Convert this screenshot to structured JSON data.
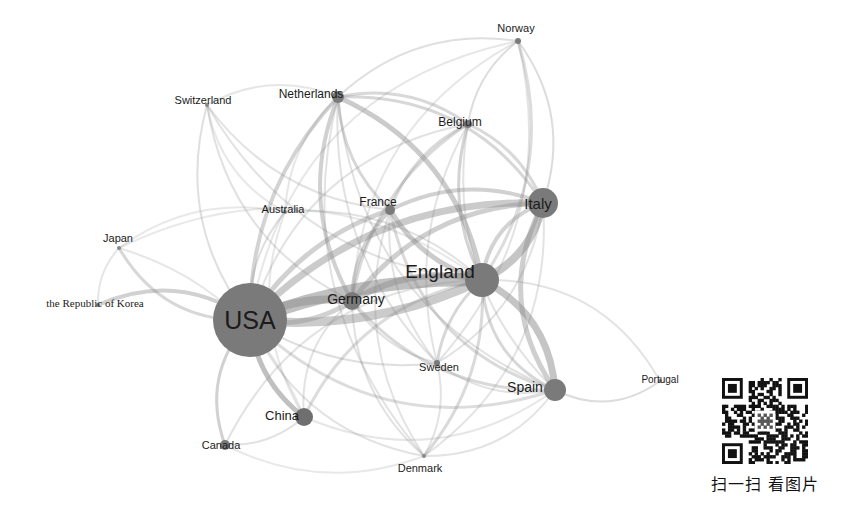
{
  "chart_data": {
    "type": "network-graph",
    "title": "",
    "background": "#ffffff",
    "node_color": "#7d7d7d",
    "edge_color": "#8c8c8c",
    "label_color": "#1b1b1b",
    "layout": "force-directed",
    "width": 842,
    "height": 505,
    "nodes": [
      {
        "id": "usa",
        "label": "USA",
        "x": 250,
        "y": 320,
        "r": 37,
        "font_size": 25,
        "label_dx": 0,
        "label_dy": 0,
        "color": "#7a7a7a",
        "serif": false
      },
      {
        "id": "england",
        "label": "England",
        "x": 482,
        "y": 280,
        "r": 17,
        "font_size": 19,
        "label_dx": -42,
        "label_dy": -9,
        "color": "#7a7a7a",
        "serif": false
      },
      {
        "id": "italy",
        "label": "Italy",
        "x": 543,
        "y": 203,
        "r": 15,
        "font_size": 15,
        "label_dx": -5,
        "label_dy": 0,
        "color": "#7a7a7a",
        "serif": false
      },
      {
        "id": "spain",
        "label": "Spain",
        "x": 555,
        "y": 390,
        "r": 11,
        "font_size": 14,
        "label_dx": -30,
        "label_dy": -3,
        "color": "#7a7a7a",
        "serif": false
      },
      {
        "id": "germany",
        "label": "Germany",
        "x": 352,
        "y": 301,
        "r": 9,
        "font_size": 14,
        "label_dx": 4,
        "label_dy": -2,
        "color": "#7a7a7a",
        "serif": false
      },
      {
        "id": "china",
        "label": "China",
        "x": 304,
        "y": 417,
        "r": 9,
        "font_size": 13,
        "label_dx": -22,
        "label_dy": -2,
        "color": "#6f6f6f",
        "serif": false
      },
      {
        "id": "france",
        "label": "France",
        "x": 390,
        "y": 210,
        "r": 5,
        "font_size": 12,
        "label_dx": -12,
        "label_dy": -8,
        "color": "#7a7a7a",
        "serif": false
      },
      {
        "id": "netherlands",
        "label": "Netherlands",
        "x": 338,
        "y": 97,
        "r": 6,
        "font_size": 12,
        "label_dx": -27,
        "label_dy": -3,
        "color": "#7a7a7a",
        "serif": false
      },
      {
        "id": "canada",
        "label": "Canada",
        "x": 225,
        "y": 445,
        "r": 5,
        "font_size": 11,
        "label_dx": -4,
        "label_dy": 0,
        "color": "#7a7a7a",
        "serif": false
      },
      {
        "id": "belgium",
        "label": "Belgium",
        "x": 468,
        "y": 124,
        "r": 4,
        "font_size": 12,
        "label_dx": -8,
        "label_dy": -2,
        "color": "#7a7a7a",
        "serif": false
      },
      {
        "id": "norway",
        "label": "Norway",
        "x": 518,
        "y": 41,
        "r": 3,
        "font_size": 11,
        "label_dx": -2,
        "label_dy": -13,
        "color": "#7a7a7a",
        "serif": false
      },
      {
        "id": "sweden",
        "label": "Sweden",
        "x": 437,
        "y": 363,
        "r": 3,
        "font_size": 11,
        "label_dx": 2,
        "label_dy": 4,
        "color": "#7a7a7a",
        "serif": false
      },
      {
        "id": "switzerland",
        "label": "Switzerland",
        "x": 207,
        "y": 105,
        "r": 2,
        "font_size": 11,
        "label_dx": -4,
        "label_dy": -5,
        "color": "#8a8a8a",
        "serif": false
      },
      {
        "id": "australia",
        "label": "Australia",
        "x": 285,
        "y": 212,
        "r": 2,
        "font_size": 11,
        "label_dx": -2,
        "label_dy": -3,
        "color": "#8a8a8a",
        "serif": false
      },
      {
        "id": "japan",
        "label": "Japan",
        "x": 119,
        "y": 248,
        "r": 2,
        "font_size": 11,
        "label_dx": -1,
        "label_dy": -10,
        "color": "#8a8a8a",
        "serif": false
      },
      {
        "id": "korea",
        "label": "the Republic of Korea",
        "x": 98,
        "y": 305,
        "r": 2,
        "font_size": 11,
        "label_dx": -3,
        "label_dy": -2,
        "color": "#8a8a8a",
        "serif": true
      },
      {
        "id": "denmark",
        "label": "Denmark",
        "x": 424,
        "y": 456,
        "r": 2,
        "font_size": 11,
        "label_dx": -4,
        "label_dy": 12,
        "color": "#8a8a8a",
        "serif": false
      },
      {
        "id": "portugal",
        "label": "Portugal",
        "x": 660,
        "y": 381,
        "r": 2,
        "font_size": 10,
        "label_dx": 0,
        "label_dy": -1,
        "color": "#8a8a8a",
        "serif": false
      }
    ],
    "edges": [
      {
        "source": "usa",
        "target": "england",
        "weight": 10,
        "width": 13,
        "opacity": 0.55,
        "curve": -0.1
      },
      {
        "source": "usa",
        "target": "england",
        "weight": 8,
        "width": 9,
        "opacity": 0.45,
        "curve": 0.14
      },
      {
        "source": "usa",
        "target": "germany",
        "weight": 7,
        "width": 8,
        "opacity": 0.5,
        "curve": -0.16
      },
      {
        "source": "usa",
        "target": "germany",
        "weight": 5,
        "width": 5,
        "opacity": 0.4,
        "curve": 0.2
      },
      {
        "source": "usa",
        "target": "italy",
        "weight": 6,
        "width": 7,
        "opacity": 0.45,
        "curve": -0.22
      },
      {
        "source": "usa",
        "target": "france",
        "weight": 4,
        "width": 5,
        "opacity": 0.4,
        "curve": -0.18
      },
      {
        "source": "usa",
        "target": "netherlands",
        "weight": 4,
        "width": 4,
        "opacity": 0.38,
        "curve": -0.2
      },
      {
        "source": "usa",
        "target": "china",
        "weight": 5,
        "width": 5,
        "opacity": 0.55,
        "curve": 0.22
      },
      {
        "source": "usa",
        "target": "canada",
        "weight": 3,
        "width": 3,
        "opacity": 0.4,
        "curve": 0.3
      },
      {
        "source": "usa",
        "target": "japan",
        "weight": 3,
        "width": 3,
        "opacity": 0.35,
        "curve": -0.3
      },
      {
        "source": "usa",
        "target": "korea",
        "weight": 3,
        "width": 4,
        "opacity": 0.4,
        "curve": 0.28
      },
      {
        "source": "usa",
        "target": "switzerland",
        "weight": 2,
        "width": 2,
        "opacity": 0.28,
        "curve": -0.25
      },
      {
        "source": "usa",
        "target": "australia",
        "weight": 2,
        "width": 2,
        "opacity": 0.28,
        "curve": -0.2
      },
      {
        "source": "usa",
        "target": "spain",
        "weight": 3,
        "width": 3,
        "opacity": 0.3,
        "curve": 0.3
      },
      {
        "source": "usa",
        "target": "sweden",
        "weight": 2,
        "width": 2,
        "opacity": 0.28,
        "curve": 0.18
      },
      {
        "source": "usa",
        "target": "denmark",
        "weight": 2,
        "width": 2,
        "opacity": 0.25,
        "curve": 0.26
      },
      {
        "source": "usa",
        "target": "belgium",
        "weight": 2,
        "width": 2,
        "opacity": 0.25,
        "curve": -0.3
      },
      {
        "source": "usa",
        "target": "norway",
        "weight": 2,
        "width": 2,
        "opacity": 0.22,
        "curve": -0.34
      },
      {
        "source": "england",
        "target": "italy",
        "weight": 7,
        "width": 8,
        "opacity": 0.5,
        "curve": 0.25
      },
      {
        "source": "england",
        "target": "italy",
        "weight": 4,
        "width": 4,
        "opacity": 0.38,
        "curve": -0.3
      },
      {
        "source": "england",
        "target": "spain",
        "weight": 6,
        "width": 7,
        "opacity": 0.5,
        "curve": -0.28
      },
      {
        "source": "england",
        "target": "spain",
        "weight": 3,
        "width": 3,
        "opacity": 0.35,
        "curve": 0.3
      },
      {
        "source": "england",
        "target": "germany",
        "weight": 6,
        "width": 6,
        "opacity": 0.45,
        "curve": 0.2
      },
      {
        "source": "england",
        "target": "france",
        "weight": 5,
        "width": 5,
        "opacity": 0.45,
        "curve": -0.2
      },
      {
        "source": "england",
        "target": "netherlands",
        "weight": 5,
        "width": 5,
        "opacity": 0.45,
        "curve": 0.26
      },
      {
        "source": "england",
        "target": "belgium",
        "weight": 3,
        "width": 3,
        "opacity": 0.38,
        "curve": -0.2
      },
      {
        "source": "england",
        "target": "sweden",
        "weight": 3,
        "width": 3,
        "opacity": 0.35,
        "curve": 0.18
      },
      {
        "source": "england",
        "target": "denmark",
        "weight": 3,
        "width": 3,
        "opacity": 0.32,
        "curve": -0.2
      },
      {
        "source": "england",
        "target": "norway",
        "weight": 3,
        "width": 3,
        "opacity": 0.3,
        "curve": 0.24
      },
      {
        "source": "england",
        "target": "china",
        "weight": 3,
        "width": 3,
        "opacity": 0.3,
        "curve": 0.25
      },
      {
        "source": "england",
        "target": "canada",
        "weight": 2,
        "width": 2,
        "opacity": 0.25,
        "curve": 0.3
      },
      {
        "source": "england",
        "target": "switzerland",
        "weight": 2,
        "width": 2,
        "opacity": 0.25,
        "curve": -0.26
      },
      {
        "source": "england",
        "target": "australia",
        "weight": 2,
        "width": 2,
        "opacity": 0.26,
        "curve": 0.22
      },
      {
        "source": "england",
        "target": "portugal",
        "weight": 2,
        "width": 2,
        "opacity": 0.24,
        "curve": -0.3
      },
      {
        "source": "england",
        "target": "japan",
        "weight": 2,
        "width": 2,
        "opacity": 0.2,
        "curve": 0.3
      },
      {
        "source": "italy",
        "target": "spain",
        "weight": 4,
        "width": 5,
        "opacity": 0.42,
        "curve": 0.3
      },
      {
        "source": "italy",
        "target": "france",
        "weight": 4,
        "width": 4,
        "opacity": 0.4,
        "curve": 0.22
      },
      {
        "source": "italy",
        "target": "germany",
        "weight": 4,
        "width": 5,
        "opacity": 0.42,
        "curve": 0.24
      },
      {
        "source": "italy",
        "target": "netherlands",
        "weight": 3,
        "width": 3,
        "opacity": 0.35,
        "curve": 0.28
      },
      {
        "source": "italy",
        "target": "belgium",
        "weight": 3,
        "width": 3,
        "opacity": 0.33,
        "curve": 0.2
      },
      {
        "source": "italy",
        "target": "norway",
        "weight": 2,
        "width": 2,
        "opacity": 0.3,
        "curve": 0.26
      },
      {
        "source": "italy",
        "target": "sweden",
        "weight": 2,
        "width": 2,
        "opacity": 0.26,
        "curve": -0.24
      },
      {
        "source": "italy",
        "target": "denmark",
        "weight": 2,
        "width": 2,
        "opacity": 0.24,
        "curve": -0.28
      },
      {
        "source": "germany",
        "target": "france",
        "weight": 4,
        "width": 4,
        "opacity": 0.4,
        "curve": -0.2
      },
      {
        "source": "germany",
        "target": "netherlands",
        "weight": 4,
        "width": 4,
        "opacity": 0.4,
        "curve": -0.24
      },
      {
        "source": "germany",
        "target": "spain",
        "weight": 3,
        "width": 3,
        "opacity": 0.33,
        "curve": 0.24
      },
      {
        "source": "germany",
        "target": "belgium",
        "weight": 3,
        "width": 3,
        "opacity": 0.32,
        "curve": -0.22
      },
      {
        "source": "germany",
        "target": "sweden",
        "weight": 2,
        "width": 2,
        "opacity": 0.28,
        "curve": 0.2
      },
      {
        "source": "germany",
        "target": "denmark",
        "weight": 2,
        "width": 2,
        "opacity": 0.26,
        "curve": 0.22
      },
      {
        "source": "germany",
        "target": "switzerland",
        "weight": 2,
        "width": 2,
        "opacity": 0.26,
        "curve": -0.26
      },
      {
        "source": "germany",
        "target": "norway",
        "weight": 2,
        "width": 2,
        "opacity": 0.22,
        "curve": -0.28
      },
      {
        "source": "germany",
        "target": "china",
        "weight": 2,
        "width": 2,
        "opacity": 0.25,
        "curve": 0.26
      },
      {
        "source": "france",
        "target": "netherlands",
        "weight": 3,
        "width": 3,
        "opacity": 0.35,
        "curve": -0.2
      },
      {
        "source": "france",
        "target": "belgium",
        "weight": 3,
        "width": 3,
        "opacity": 0.33,
        "curve": -0.2
      },
      {
        "source": "france",
        "target": "spain",
        "weight": 3,
        "width": 3,
        "opacity": 0.32,
        "curve": 0.3
      },
      {
        "source": "france",
        "target": "sweden",
        "weight": 2,
        "width": 2,
        "opacity": 0.25,
        "curve": 0.2
      },
      {
        "source": "france",
        "target": "denmark",
        "weight": 2,
        "width": 2,
        "opacity": 0.24,
        "curve": 0.24
      },
      {
        "source": "france",
        "target": "switzerland",
        "weight": 2,
        "width": 2,
        "opacity": 0.25,
        "curve": -0.22
      },
      {
        "source": "netherlands",
        "target": "belgium",
        "weight": 3,
        "width": 3,
        "opacity": 0.34,
        "curve": -0.22
      },
      {
        "source": "netherlands",
        "target": "norway",
        "weight": 2,
        "width": 2,
        "opacity": 0.28,
        "curve": -0.24
      },
      {
        "source": "netherlands",
        "target": "sweden",
        "weight": 2,
        "width": 2,
        "opacity": 0.26,
        "curve": 0.22
      },
      {
        "source": "netherlands",
        "target": "denmark",
        "weight": 2,
        "width": 2,
        "opacity": 0.25,
        "curve": 0.26
      },
      {
        "source": "netherlands",
        "target": "spain",
        "weight": 2,
        "width": 2,
        "opacity": 0.26,
        "curve": 0.3
      },
      {
        "source": "netherlands",
        "target": "australia",
        "weight": 2,
        "width": 2,
        "opacity": 0.22,
        "curve": 0.2
      },
      {
        "source": "netherlands",
        "target": "switzerland",
        "weight": 2,
        "width": 2,
        "opacity": 0.22,
        "curve": 0.24
      },
      {
        "source": "belgium",
        "target": "norway",
        "weight": 2,
        "width": 2,
        "opacity": 0.3,
        "curve": -0.2
      },
      {
        "source": "belgium",
        "target": "spain",
        "weight": 2,
        "width": 2,
        "opacity": 0.25,
        "curve": 0.26
      },
      {
        "source": "belgium",
        "target": "sweden",
        "weight": 2,
        "width": 2,
        "opacity": 0.24,
        "curve": 0.2
      },
      {
        "source": "spain",
        "target": "portugal",
        "weight": 2,
        "width": 2,
        "opacity": 0.3,
        "curve": 0.3
      },
      {
        "source": "spain",
        "target": "sweden",
        "weight": 2,
        "width": 2,
        "opacity": 0.25,
        "curve": -0.22
      },
      {
        "source": "spain",
        "target": "denmark",
        "weight": 2,
        "width": 2,
        "opacity": 0.24,
        "curve": -0.26
      },
      {
        "source": "spain",
        "target": "china",
        "weight": 2,
        "width": 2,
        "opacity": 0.22,
        "curve": -0.28
      },
      {
        "source": "china",
        "target": "canada",
        "weight": 2,
        "width": 2,
        "opacity": 0.26,
        "curve": -0.2
      },
      {
        "source": "china",
        "target": "japan",
        "weight": 2,
        "width": 2,
        "opacity": 0.22,
        "curve": 0.24
      },
      {
        "source": "china",
        "target": "australia",
        "weight": 2,
        "width": 2,
        "opacity": 0.22,
        "curve": -0.24
      },
      {
        "source": "japan",
        "target": "australia",
        "weight": 2,
        "width": 2,
        "opacity": 0.2,
        "curve": -0.22
      },
      {
        "source": "japan",
        "target": "korea",
        "weight": 2,
        "width": 2,
        "opacity": 0.22,
        "curve": 0.2
      },
      {
        "source": "switzerland",
        "target": "australia",
        "weight": 2,
        "width": 2,
        "opacity": 0.2,
        "curve": 0.24
      },
      {
        "source": "sweden",
        "target": "denmark",
        "weight": 2,
        "width": 2,
        "opacity": 0.24,
        "curve": -0.2
      },
      {
        "source": "sweden",
        "target": "norway",
        "weight": 2,
        "width": 2,
        "opacity": 0.24,
        "curve": 0.26
      },
      {
        "source": "canada",
        "target": "denmark",
        "weight": 2,
        "width": 2,
        "opacity": 0.2,
        "curve": 0.22
      }
    ]
  },
  "qr": {
    "caption": "扫一扫  看图片",
    "x": 711,
    "y": 378,
    "size": 86,
    "modules": 29
  }
}
